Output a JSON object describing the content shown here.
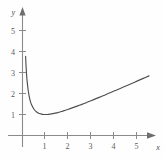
{
  "chart_data": {
    "type": "line",
    "title": "",
    "xlabel": "x",
    "ylabel": "y",
    "xlim": [
      -0.45,
      6.1
    ],
    "ylim": [
      -0.5,
      6.35
    ],
    "grid": false,
    "legend": null,
    "x_ticks": [
      1,
      2,
      3,
      4,
      5
    ],
    "x_tick_labels": [
      "1",
      "2",
      "3",
      "4",
      "5"
    ],
    "y_ticks": [
      1,
      2,
      3,
      4,
      5
    ],
    "y_tick_labels": [
      "1",
      "2",
      "3",
      "4",
      "5"
    ],
    "series": [
      {
        "name": "y = (x + 1/x) / 2",
        "x": [
          0.135,
          0.15,
          0.175,
          0.2,
          0.25,
          0.3,
          0.35,
          0.4,
          0.5,
          0.6,
          0.7,
          0.8,
          0.9,
          1.0,
          1.1,
          1.25,
          1.5,
          1.75,
          2.0,
          2.25,
          2.5,
          2.75,
          3.0,
          3.25,
          3.5,
          3.75,
          4.0,
          4.25,
          4.5,
          4.75,
          5.0,
          5.25,
          5.5
        ],
        "y": [
          3.77,
          3.41,
          2.94,
          2.6,
          2.13,
          1.82,
          1.6,
          1.45,
          1.25,
          1.13,
          1.06,
          1.03,
          1.0,
          1.0,
          1.0,
          1.03,
          1.08,
          1.16,
          1.25,
          1.35,
          1.45,
          1.55,
          1.67,
          1.78,
          1.89,
          2.01,
          2.13,
          2.24,
          2.36,
          2.48,
          2.6,
          2.72,
          2.84
        ],
        "color": "#4f4f4f",
        "minimum_point": [
          1,
          1
        ]
      }
    ],
    "annotations": {
      "y_axis_arrow": "up",
      "x_axis_arrow": "right",
      "curve_start": [
        0.135,
        3.77
      ],
      "curve_end": [
        5.5,
        2.84
      ]
    }
  },
  "axes": {
    "y_axis_label": "y",
    "x_axis_label": "x"
  },
  "icons": {
    "y_arrow": "arrow-up-icon",
    "x_arrow": "arrow-right-icon"
  }
}
